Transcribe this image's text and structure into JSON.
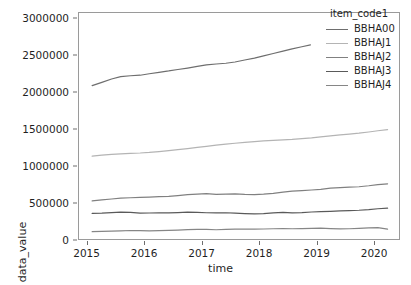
{
  "chart_data": {
    "type": "line",
    "title": "",
    "xlabel": "time",
    "ylabel": "data_value",
    "legend_title": "item_code1",
    "legend_position": "upper right",
    "grid": false,
    "xlim": [
      2014.85,
      2020.45
    ],
    "ylim": [
      0,
      3080000
    ],
    "xticks": [
      2015,
      2016,
      2017,
      2018,
      2019,
      2020
    ],
    "xtick_labels": [
      "2015",
      "2016",
      "2017",
      "2018",
      "2019",
      "2020"
    ],
    "yticks": [
      0,
      500000,
      1000000,
      1500000,
      2000000,
      2500000,
      3000000
    ],
    "ytick_labels": [
      "0",
      "500000",
      "1000000",
      "1500000",
      "2000000",
      "2500000",
      "3000000"
    ],
    "series": [
      {
        "name": "BBHA00",
        "color": "#6e6e6e",
        "x": [
          2015.08,
          2015.25,
          2015.42,
          2015.58,
          2015.75,
          2015.92,
          2016.08,
          2016.25,
          2016.42,
          2016.58,
          2016.75,
          2016.92,
          2017.08,
          2017.25,
          2017.42,
          2017.58,
          2017.75,
          2017.92,
          2018.08,
          2018.25,
          2018.42,
          2018.58,
          2018.75,
          2018.9
        ],
        "values": [
          2090000,
          2135000,
          2180000,
          2212000,
          2225000,
          2232000,
          2252000,
          2272000,
          2290000,
          2310000,
          2330000,
          2352000,
          2372000,
          2385000,
          2395000,
          2412000,
          2440000,
          2465000,
          2495000,
          2528000,
          2560000,
          2592000,
          2620000,
          2645000
        ]
      },
      {
        "name": "BBHAJ1",
        "color": "#b4b4b4",
        "x": [
          2015.08,
          2015.25,
          2015.42,
          2015.58,
          2015.75,
          2015.92,
          2016.08,
          2016.25,
          2016.42,
          2016.58,
          2016.75,
          2016.92,
          2017.08,
          2017.25,
          2017.42,
          2017.58,
          2017.75,
          2017.92,
          2018.08,
          2018.25,
          2018.42,
          2018.58,
          2018.75,
          2018.92,
          2019.08,
          2019.25,
          2019.42,
          2019.58,
          2019.75,
          2019.92,
          2020.08,
          2020.25
        ],
        "values": [
          1130000,
          1142000,
          1152000,
          1160000,
          1168000,
          1172000,
          1180000,
          1192000,
          1205000,
          1218000,
          1232000,
          1248000,
          1262000,
          1278000,
          1292000,
          1305000,
          1318000,
          1328000,
          1338000,
          1345000,
          1352000,
          1358000,
          1368000,
          1378000,
          1392000,
          1405000,
          1418000,
          1430000,
          1442000,
          1458000,
          1475000,
          1490000
        ]
      },
      {
        "name": "BBHAJ2",
        "color": "#808080",
        "x": [
          2015.08,
          2015.25,
          2015.42,
          2015.58,
          2015.75,
          2015.92,
          2016.08,
          2016.25,
          2016.42,
          2016.58,
          2016.75,
          2016.92,
          2017.08,
          2017.25,
          2017.42,
          2017.58,
          2017.75,
          2017.92,
          2018.08,
          2018.25,
          2018.42,
          2018.58,
          2018.75,
          2018.92,
          2019.08,
          2019.25,
          2019.42,
          2019.58,
          2019.75,
          2019.92,
          2020.08,
          2020.25
        ],
        "values": [
          520000,
          532000,
          545000,
          556000,
          562000,
          566000,
          572000,
          578000,
          582000,
          592000,
          605000,
          612000,
          618000,
          608000,
          612000,
          616000,
          608000,
          606000,
          612000,
          622000,
          640000,
          652000,
          660000,
          668000,
          676000,
          692000,
          700000,
          706000,
          712000,
          726000,
          742000,
          752000
        ]
      },
      {
        "name": "BBHAJ3",
        "color": "#5a5a5a",
        "x": [
          2015.08,
          2015.25,
          2015.42,
          2015.58,
          2015.75,
          2015.92,
          2016.08,
          2016.25,
          2016.42,
          2016.58,
          2016.75,
          2016.92,
          2017.08,
          2017.25,
          2017.42,
          2017.58,
          2017.75,
          2017.92,
          2018.08,
          2018.25,
          2018.42,
          2018.58,
          2018.75,
          2018.92,
          2019.08,
          2019.25,
          2019.42,
          2019.58,
          2019.75,
          2019.92,
          2020.08,
          2020.25
        ],
        "values": [
          348000,
          352000,
          360000,
          366000,
          362000,
          352000,
          354000,
          358000,
          356000,
          360000,
          366000,
          362000,
          358000,
          356000,
          358000,
          352000,
          346000,
          342000,
          346000,
          356000,
          362000,
          356000,
          360000,
          368000,
          372000,
          376000,
          382000,
          388000,
          392000,
          400000,
          412000,
          420000
        ]
      },
      {
        "name": "BBHAJ4",
        "color": "#868686",
        "x": [
          2015.08,
          2015.25,
          2015.42,
          2015.58,
          2015.75,
          2015.92,
          2016.08,
          2016.25,
          2016.42,
          2016.58,
          2016.75,
          2016.92,
          2017.08,
          2017.25,
          2017.42,
          2017.58,
          2017.75,
          2017.92,
          2018.08,
          2018.25,
          2018.42,
          2018.58,
          2018.75,
          2018.92,
          2019.08,
          2019.25,
          2019.42,
          2019.58,
          2019.75,
          2019.92,
          2020.08,
          2020.25
        ],
        "values": [
          100000,
          104000,
          108000,
          112000,
          116000,
          114000,
          112000,
          114000,
          118000,
          122000,
          128000,
          132000,
          130000,
          126000,
          130000,
          134000,
          136000,
          134000,
          136000,
          140000,
          142000,
          140000,
          142000,
          146000,
          148000,
          142000,
          138000,
          140000,
          146000,
          152000,
          156000,
          134000
        ]
      }
    ]
  }
}
